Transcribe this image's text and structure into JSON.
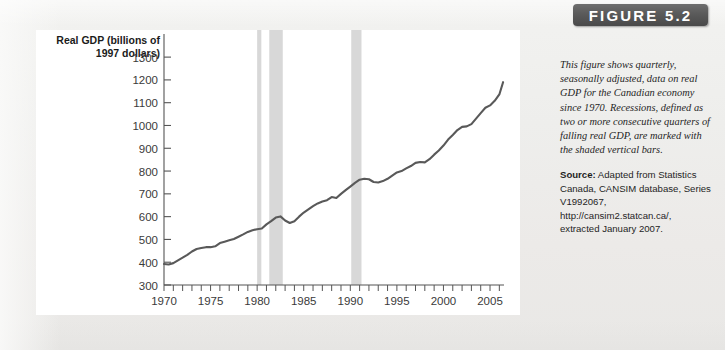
{
  "badge": {
    "label": "FIGURE 5.2"
  },
  "caption": {
    "text": "This figure shows quarterly, seasonally adjusted, data on real GDP for the Canadian economy since 1970. Recessions, defined as two or more consecutive quarters of falling real GDP, are marked with the shaded vertical bars."
  },
  "source": {
    "label": "Source:",
    "text": " Adapted from Statistics Canada, CANSIM database, Series V1992067, http://cansim2.statcan.ca/, extracted January 2007."
  },
  "colors": {
    "line": "#595959",
    "recession_band": "#d8d8d8",
    "axis": "#555555",
    "badge_bg": "#5a5a5a",
    "badge_text": "#ffffff",
    "plot_bg": "#ffffff",
    "page_bg": "#eeeeec"
  },
  "chart_data": {
    "type": "line",
    "title": "",
    "ylabel": "Real GDP (billions of 1997 dollars)",
    "xlabel": "",
    "xlim": [
      1970,
      2006.5
    ],
    "ylim": [
      300,
      1340
    ],
    "grid": false,
    "legend": "none",
    "y_ticks": [
      300,
      400,
      500,
      600,
      700,
      800,
      900,
      1000,
      1100,
      1200,
      1300
    ],
    "y_tick_labels": [
      "300",
      "400",
      "500",
      "600",
      "700",
      "800",
      "900",
      "1000",
      "1100",
      "1200",
      "1300"
    ],
    "x_ticks": [
      1970,
      1971,
      1972,
      1973,
      1974,
      1975,
      1976,
      1977,
      1978,
      1979,
      1980,
      1981,
      1982,
      1983,
      1984,
      1985,
      1986,
      1987,
      1988,
      1989,
      1990,
      1991,
      1992,
      1993,
      1994,
      1995,
      1996,
      1997,
      1998,
      1999,
      2000,
      2001,
      2002,
      2003,
      2004,
      2005,
      2006
    ],
    "x_tick_labels": [
      {
        "x": 1970,
        "label": "1970"
      },
      {
        "x": 1975,
        "label": "1975"
      },
      {
        "x": 1980,
        "label": "1980"
      },
      {
        "x": 1985,
        "label": "1985"
      },
      {
        "x": 1990,
        "label": "1990"
      },
      {
        "x": 1995,
        "label": "1995"
      },
      {
        "x": 2000,
        "label": "2000"
      },
      {
        "x": 2005,
        "label": "2005"
      }
    ],
    "recession_bands": [
      {
        "start": 1980.0,
        "end": 1980.45
      },
      {
        "start": 1981.3,
        "end": 1982.75
      },
      {
        "start": 1990.1,
        "end": 1991.2
      }
    ],
    "series": [
      {
        "name": "Real GDP",
        "x": [
          1970.0,
          1970.5,
          1971.0,
          1971.5,
          1972.0,
          1972.5,
          1973.0,
          1973.5,
          1974.0,
          1974.5,
          1975.0,
          1975.5,
          1976.0,
          1976.5,
          1977.0,
          1977.5,
          1978.0,
          1978.5,
          1979.0,
          1979.5,
          1980.0,
          1980.5,
          1981.0,
          1981.5,
          1982.0,
          1982.5,
          1983.0,
          1983.5,
          1984.0,
          1984.5,
          1985.0,
          1985.5,
          1986.0,
          1986.5,
          1987.0,
          1987.5,
          1988.0,
          1988.5,
          1989.0,
          1989.5,
          1990.0,
          1990.5,
          1991.0,
          1991.5,
          1992.0,
          1992.5,
          1993.0,
          1993.5,
          1994.0,
          1994.5,
          1995.0,
          1995.5,
          1996.0,
          1996.5,
          1997.0,
          1997.5,
          1998.0,
          1998.5,
          1999.0,
          1999.5,
          2000.0,
          2000.5,
          2001.0,
          2001.5,
          2002.0,
          2002.5,
          2003.0,
          2003.5,
          2004.0,
          2004.5,
          2005.0,
          2005.5,
          2006.0,
          2006.4
        ],
        "y": [
          392,
          390,
          396,
          408,
          420,
          432,
          447,
          458,
          462,
          466,
          466,
          470,
          484,
          490,
          496,
          502,
          512,
          522,
          533,
          540,
          545,
          548,
          566,
          580,
          596,
          601,
          583,
          572,
          580,
          600,
          618,
          632,
          646,
          658,
          666,
          672,
          686,
          682,
          700,
          716,
          732,
          748,
          762,
          766,
          764,
          752,
          750,
          756,
          766,
          780,
          794,
          800,
          812,
          822,
          836,
          840,
          838,
          852,
          872,
          890,
          912,
          938,
          958,
          980,
          994,
          996,
          1006,
          1030,
          1054,
          1078,
          1088,
          1108,
          1136,
          1190
        ]
      }
    ]
  }
}
